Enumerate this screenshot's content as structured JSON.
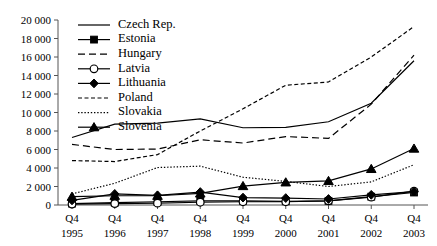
{
  "chart_data": {
    "type": "line",
    "title": "",
    "xlabel": "",
    "ylabel": "",
    "ylim": [
      0,
      20000
    ],
    "ytick_step": 2000,
    "grid": false,
    "legend_position": "top-left-inside",
    "categories": [
      "Q4 1995",
      "Q4 1996",
      "Q4 1997",
      "Q4 1998",
      "Q4 1999",
      "Q4 2000",
      "Q4 2001",
      "Q4 2002",
      "Q4 2003"
    ],
    "x_tick_top": [
      "Q4",
      "Q4",
      "Q4",
      "Q4",
      "Q4",
      "Q4",
      "Q4",
      "Q4",
      "Q4"
    ],
    "x_tick_bottom": [
      "1995",
      "1996",
      "1997",
      "1998",
      "1999",
      "2000",
      "2001",
      "2002",
      "2003"
    ],
    "y_tick_labels": [
      "20 000",
      "18 000",
      "16 000",
      "14 000",
      "12 000",
      "10 000",
      "8 000",
      "6 000",
      "4 000",
      "2 000",
      "0"
    ],
    "y_tick_values": [
      20000,
      18000,
      16000,
      14000,
      12000,
      10000,
      8000,
      6000,
      4000,
      2000,
      0
    ],
    "series": [
      {
        "name": "Czech Rep.",
        "style": "solid",
        "marker": "none",
        "color": "#000000",
        "values": [
          7300,
          8750,
          8850,
          9300,
          8350,
          8400,
          9000,
          11000,
          15600
        ]
      },
      {
        "name": "Estonia",
        "style": "solid",
        "marker": "square",
        "color": "#000000",
        "values": [
          150,
          250,
          350,
          450,
          450,
          400,
          450,
          900,
          1350
        ]
      },
      {
        "name": "Hungary",
        "style": "dashed",
        "marker": "none",
        "color": "#000000",
        "values": [
          6550,
          6000,
          6050,
          7050,
          6700,
          7400,
          7200,
          10900,
          16200
        ]
      },
      {
        "name": "Latvia",
        "style": "solid",
        "marker": "circle",
        "color": "#000000",
        "values": [
          100,
          150,
          200,
          300,
          350,
          350,
          450,
          850,
          1500
        ]
      },
      {
        "name": "Lithuania",
        "style": "solid",
        "marker": "diamond",
        "color": "#000000",
        "values": [
          500,
          1200,
          1050,
          1400,
          800,
          750,
          650,
          1100,
          1450
        ]
      },
      {
        "name": "Poland",
        "style": "dashed-short",
        "marker": "none",
        "color": "#000000",
        "values": [
          4800,
          4700,
          5450,
          8000,
          10400,
          12950,
          13300,
          16000,
          19300
        ]
      },
      {
        "name": "Slovakia",
        "style": "dotted",
        "marker": "none",
        "color": "#000000",
        "values": [
          1200,
          2350,
          4050,
          4200,
          3000,
          2550,
          2000,
          2500,
          4350
        ]
      },
      {
        "name": "Slovenia",
        "style": "solid",
        "marker": "triangle",
        "color": "#000000",
        "values": [
          900,
          1000,
          1000,
          1250,
          2050,
          2450,
          2600,
          3900,
          6100
        ]
      }
    ]
  }
}
